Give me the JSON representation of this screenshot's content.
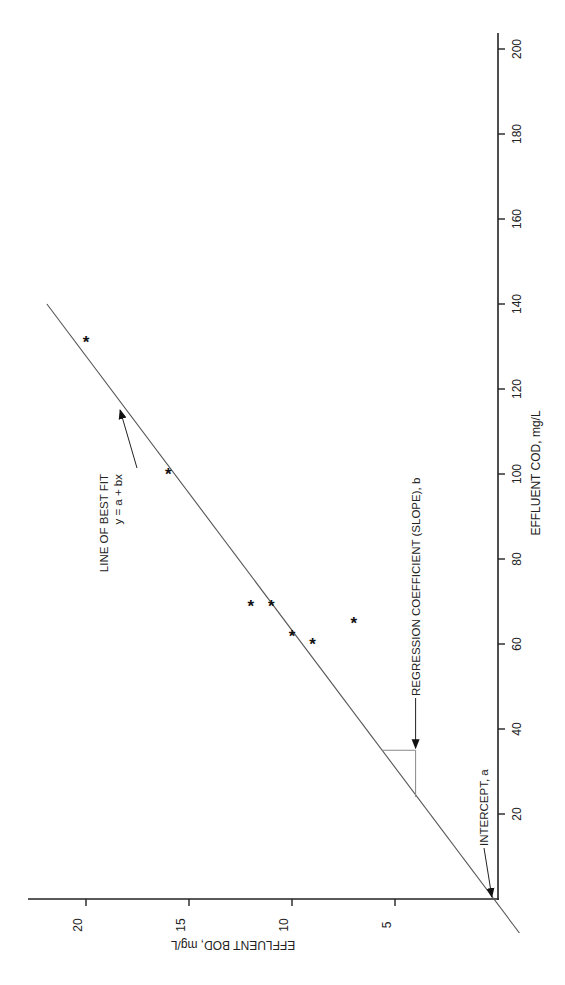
{
  "chart_data": {
    "type": "scatter",
    "orientation": "rotated 90° (x-axis drawn vertically on right, y-axis drawn horizontally along bottom)",
    "title": "",
    "xlabel": "EFFLUENT COD, mg/L",
    "ylabel": "EFFLUENT BOD, mg/L",
    "xlim": [
      0,
      200
    ],
    "ylim": [
      0,
      22
    ],
    "xticks": [
      20,
      40,
      60,
      80,
      100,
      120,
      140,
      160,
      180,
      200
    ],
    "yticks": [
      5,
      10,
      15,
      20
    ],
    "grid": false,
    "legend": null,
    "series": [
      {
        "name": "Observations",
        "marker": "*",
        "points": [
          {
            "x": 131,
            "y": 20
          },
          {
            "x": 100,
            "y": 16
          },
          {
            "x": 69,
            "y": 12
          },
          {
            "x": 69,
            "y": 11
          },
          {
            "x": 62,
            "y": 10
          },
          {
            "x": 60,
            "y": 9
          },
          {
            "x": 65,
            "y": 7
          }
        ]
      }
    ],
    "fit_line": {
      "name": "LINE OF BEST FIT",
      "equation": "y = a + bx",
      "intercept_a": 0.2,
      "slope_b": 0.155,
      "x_range": [
        -8,
        140
      ]
    },
    "slope_triangle": {
      "x_from": 24,
      "x_to": 35,
      "y_at": 4
    },
    "annotations": [
      {
        "text": "LINE OF BEST FIT",
        "text2": "y = a + bx",
        "points_to": {
          "x": 116,
          "y": 18.2
        }
      },
      {
        "text": "REGRESSION COEFFICIENT (SLOPE), b",
        "points_to": {
          "x": 35,
          "y": 4
        }
      },
      {
        "text": "INTERCEPT, a",
        "points_to": {
          "x": 0,
          "y": 0.2
        }
      }
    ]
  },
  "layout": {
    "origin_px": {
      "x": 498,
      "y": 899
    },
    "px_per_x_unit": 4.25,
    "px_per_y_unit": 20.6,
    "x_axis_end_px": 33,
    "y_axis_end_px": 28
  }
}
